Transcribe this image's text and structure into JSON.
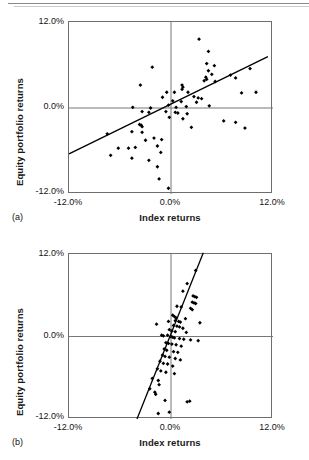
{
  "figure": {
    "panels": [
      {
        "id": "a",
        "letter": "(a)",
        "xlabel": "Index returns",
        "ylabel": "Equity portfolio returns",
        "y_ticks": [
          "12.0%",
          "0.0%",
          "-12.0%"
        ],
        "x_ticks": [
          "-12.0%",
          "0.0%",
          "12.0%"
        ]
      },
      {
        "id": "b",
        "letter": "(b)",
        "xlabel": "Index returns",
        "ylabel": "Equity portfolio returns",
        "y_ticks": [
          "12.0%",
          "0.0%",
          "-12.0%"
        ],
        "x_ticks": [
          "-12.0%",
          "0.0%",
          "12.0%"
        ]
      }
    ]
  },
  "chart_data": [
    {
      "type": "scatter",
      "panel": "a",
      "title": "",
      "xlabel": "Index returns",
      "ylabel": "Equity portfolio returns",
      "xlim": [
        -12.0,
        12.0
      ],
      "ylim": [
        -12.0,
        12.0
      ],
      "xticks": [
        -12.0,
        0.0,
        12.0
      ],
      "yticks": [
        -12.0,
        0.0,
        12.0
      ],
      "xtick_labels": [
        "-12.0%",
        "0.0%",
        "12.0%"
      ],
      "ytick_labels": [
        "-12.0%",
        "0.0%",
        "12.0%"
      ],
      "grid": false,
      "axis_lines": [
        "x=0",
        "y=0"
      ],
      "marker": "diamond",
      "marker_color": "#000000",
      "trendline": {
        "type": "linear",
        "slope": 0.58,
        "intercept": 0.55,
        "x_start": -12.0,
        "x_end": 11.4,
        "color": "#000000"
      },
      "points": [
        [
          3.3,
          9.6
        ],
        [
          4.4,
          7.9
        ],
        [
          4.2,
          6.2
        ],
        [
          5.1,
          5.9
        ],
        [
          9.3,
          5.5
        ],
        [
          -2.2,
          5.7
        ],
        [
          4.4,
          5.2
        ],
        [
          4.8,
          4.7
        ],
        [
          7.0,
          4.6
        ],
        [
          7.6,
          4.2
        ],
        [
          4.1,
          4.3
        ],
        [
          4.2,
          4.0
        ],
        [
          3.9,
          3.8
        ],
        [
          5.2,
          3.7
        ],
        [
          -3.6,
          3.2
        ],
        [
          1.3,
          3.2
        ],
        [
          1.4,
          2.9
        ],
        [
          1.3,
          2.6
        ],
        [
          -0.5,
          2.2
        ],
        [
          0.4,
          2.2
        ],
        [
          2.0,
          2.2
        ],
        [
          8.3,
          2.1
        ],
        [
          10.0,
          2.2
        ],
        [
          -1.0,
          1.5
        ],
        [
          2.7,
          1.6
        ],
        [
          3.2,
          1.4
        ],
        [
          3.6,
          1.3
        ],
        [
          0.2,
          1.0
        ],
        [
          1.2,
          0.9
        ],
        [
          3.0,
          0.8
        ],
        [
          -4.5,
          0.1
        ],
        [
          -2.4,
          0.0
        ],
        [
          -0.3,
          0.4
        ],
        [
          0.6,
          0.1
        ],
        [
          1.8,
          0.2
        ],
        [
          4.5,
          0.3
        ],
        [
          -3.4,
          -0.5
        ],
        [
          -2.6,
          -0.6
        ],
        [
          -0.6,
          -0.5
        ],
        [
          0.5,
          -0.6
        ],
        [
          0.8,
          -0.7
        ],
        [
          1.9,
          -0.8
        ],
        [
          -0.2,
          -1.3
        ],
        [
          1.4,
          -1.5
        ],
        [
          6.2,
          -1.8
        ],
        [
          7.6,
          -2.0
        ],
        [
          -3.7,
          -2.3
        ],
        [
          -3.5,
          -2.4
        ],
        [
          -3.4,
          -2.6
        ],
        [
          2.4,
          -2.7
        ],
        [
          8.7,
          -2.8
        ],
        [
          -7.5,
          -3.6
        ],
        [
          -4.6,
          -3.3
        ],
        [
          -3.4,
          -3.4
        ],
        [
          -2.0,
          -4.2
        ],
        [
          -1.1,
          -4.4
        ],
        [
          -3.0,
          -4.5
        ],
        [
          -6.2,
          -5.6
        ],
        [
          -5.0,
          -5.6
        ],
        [
          -4.2,
          -5.5
        ],
        [
          -1.6,
          -5.3
        ],
        [
          -1.2,
          -6.2
        ],
        [
          -7.1,
          -6.6
        ],
        [
          -4.6,
          -7.0
        ],
        [
          -2.6,
          -7.3
        ],
        [
          -1.6,
          -8.2
        ],
        [
          -1.4,
          -9.9
        ],
        [
          -0.3,
          -11.2
        ]
      ]
    },
    {
      "type": "scatter",
      "panel": "b",
      "title": "",
      "xlabel": "Index returns",
      "ylabel": "Equity portfolio returns",
      "xlim": [
        -12.0,
        12.0
      ],
      "ylim": [
        -12.0,
        12.0
      ],
      "xticks": [
        -12.0,
        0.0,
        12.0
      ],
      "yticks": [
        -12.0,
        0.0,
        12.0
      ],
      "xtick_labels": [
        "-12.0%",
        "0.0%",
        "12.0%"
      ],
      "ytick_labels": [
        "-12.0%",
        "0.0%",
        "12.0%"
      ],
      "grid": false,
      "axis_lines": [
        "x=0",
        "y=0"
      ],
      "marker": "diamond",
      "marker_color": "#000000",
      "trendline": {
        "type": "linear",
        "slope": 3.1,
        "intercept": 0.4,
        "x_start": -4.0,
        "x_end": 3.8,
        "color": "#000000"
      },
      "points": [
        [
          2.9,
          9.6
        ],
        [
          1.9,
          7.7
        ],
        [
          1.4,
          6.6
        ],
        [
          2.6,
          5.9
        ],
        [
          2.8,
          5.8
        ],
        [
          3.0,
          5.7
        ],
        [
          2.5,
          5.0
        ],
        [
          2.7,
          4.9
        ],
        [
          2.9,
          4.8
        ],
        [
          0.7,
          4.4
        ],
        [
          1.2,
          4.3
        ],
        [
          2.3,
          4.1
        ],
        [
          2.5,
          3.9
        ],
        [
          0.2,
          3.1
        ],
        [
          0.4,
          2.9
        ],
        [
          0.6,
          2.7
        ],
        [
          1.7,
          2.6
        ],
        [
          0.5,
          2.3
        ],
        [
          0.9,
          2.2
        ],
        [
          1.1,
          2.1
        ],
        [
          3.4,
          2.0
        ],
        [
          -0.3,
          2.2
        ],
        [
          -1.7,
          1.8
        ],
        [
          0.3,
          1.6
        ],
        [
          0.7,
          1.5
        ],
        [
          1.0,
          1.4
        ],
        [
          1.4,
          1.2
        ],
        [
          -0.2,
          1.0
        ],
        [
          0.1,
          0.8
        ],
        [
          0.5,
          0.7
        ],
        [
          1.8,
          0.6
        ],
        [
          -1.1,
          0.2
        ],
        [
          -0.9,
          0.1
        ],
        [
          -0.4,
          0.2
        ],
        [
          0.0,
          0.0
        ],
        [
          0.2,
          -0.1
        ],
        [
          0.4,
          -0.2
        ],
        [
          1.0,
          -0.3
        ],
        [
          1.5,
          -0.4
        ],
        [
          2.3,
          -0.5
        ],
        [
          3.2,
          -0.6
        ],
        [
          -0.6,
          -0.9
        ],
        [
          -0.3,
          -1.0
        ],
        [
          0.1,
          -1.1
        ],
        [
          0.6,
          -1.2
        ],
        [
          1.2,
          -1.4
        ],
        [
          -0.8,
          -1.8
        ],
        [
          -0.5,
          -2.0
        ],
        [
          0.3,
          -2.2
        ],
        [
          0.8,
          -2.3
        ],
        [
          -1.0,
          -2.7
        ],
        [
          -0.7,
          -2.9
        ],
        [
          -0.2,
          -3.0
        ],
        [
          0.5,
          -3.2
        ],
        [
          1.1,
          -3.4
        ],
        [
          -1.3,
          -3.6
        ],
        [
          -0.9,
          -3.9
        ],
        [
          -0.4,
          -4.0
        ],
        [
          0.2,
          -4.3
        ],
        [
          -1.6,
          -4.7
        ],
        [
          -1.2,
          -5.0
        ],
        [
          -0.6,
          -5.2
        ],
        [
          0.4,
          -5.4
        ],
        [
          -2.2,
          -6.1
        ],
        [
          -1.5,
          -6.4
        ],
        [
          -1.4,
          -7.0
        ],
        [
          -2.5,
          -7.6
        ],
        [
          -1.9,
          -8.1
        ],
        [
          -1.8,
          -8.4
        ],
        [
          -0.7,
          -9.3
        ],
        [
          1.9,
          -9.5
        ],
        [
          2.2,
          -9.4
        ],
        [
          -1.5,
          -11.2
        ],
        [
          -0.2,
          -11.0
        ]
      ]
    }
  ]
}
